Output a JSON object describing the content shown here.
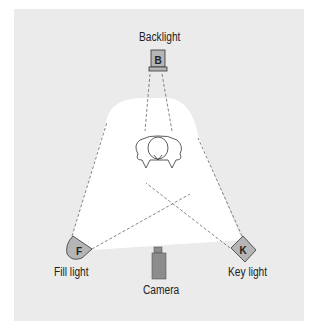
{
  "diagram": {
    "background_color": "#ebebeb",
    "light_area_color": "#ffffff",
    "fixture_color": "#b5b5b5",
    "camera_color": "#8c8c8c",
    "elements": {
      "backlight": {
        "label": "Backlight",
        "glyph": "B"
      },
      "fill_light": {
        "label": "Fill light",
        "glyph": "F"
      },
      "key_light": {
        "label": "Key light",
        "glyph": "K"
      },
      "camera": {
        "label": "Camera"
      },
      "subject": {
        "label": ""
      }
    }
  }
}
